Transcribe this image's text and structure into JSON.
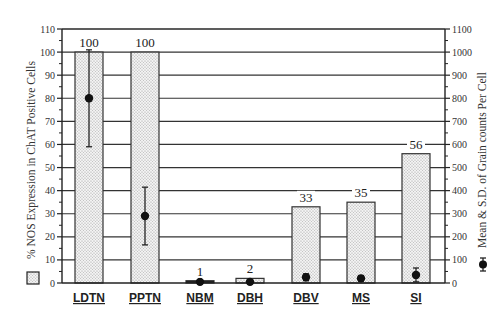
{
  "chart_data": {
    "type": "bar",
    "title": "",
    "xlabel": "",
    "ylabel": "% NOS Expression in ChAT Positive Cells",
    "y2label": "Mean & S.D. of Grain counts Per Cell",
    "ylim": [
      0,
      110
    ],
    "y2lim": [
      0,
      1100
    ],
    "yticks": [
      0,
      10,
      20,
      30,
      40,
      50,
      60,
      70,
      80,
      90,
      100,
      110
    ],
    "y2ticks": [
      0,
      100,
      200,
      300,
      400,
      500,
      600,
      700,
      800,
      900,
      1000,
      1100
    ],
    "grid": true,
    "categories": [
      "LDTN",
      "PPTN",
      "NBM",
      "DBH",
      "DBV",
      "MS",
      "SI"
    ],
    "series": [
      {
        "name": "% NOS Expression in ChAT Positive Cells",
        "type": "bar",
        "axis": "left",
        "values": [
          100,
          100,
          1,
          2,
          33,
          35,
          56
        ],
        "labels": [
          "100",
          "100",
          "1",
          "2",
          "33",
          "35",
          "56"
        ]
      },
      {
        "name": "Mean & S.D. of Grain counts Per Cell",
        "type": "errorbar",
        "axis": "right",
        "values": [
          800,
          290,
          5,
          5,
          25,
          20,
          35
        ],
        "sd": [
          210,
          125,
          0,
          0,
          15,
          12,
          30
        ]
      }
    ],
    "legend": [
      {
        "marker": "dotted-box",
        "label": "% NOS Expression in ChAT Positive Cells",
        "position": "left"
      },
      {
        "marker": "dot-errorbar",
        "label": "Mean & S.D. of Grain counts Per Cell",
        "position": "right"
      }
    ]
  }
}
